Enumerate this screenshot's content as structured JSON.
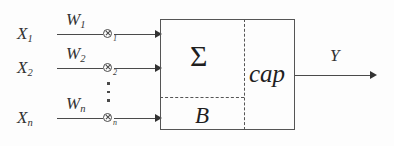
{
  "diagram": {
    "background_color": "#fdfdfd",
    "line_color": "#4a4a4a",
    "text_color": "#2b2b2b",
    "inputs": [
      {
        "input_label": "X",
        "input_subscript": "1",
        "weight_label": "W",
        "weight_subscript": "1",
        "operator_icon": "circled-times-icon",
        "operator_subscript": "1"
      },
      {
        "input_label": "X",
        "input_subscript": "2",
        "weight_label": "W",
        "weight_subscript": "2",
        "operator_icon": "circled-times-icon",
        "operator_subscript": "2"
      },
      {
        "input_label": "X",
        "input_subscript": "n",
        "weight_label": "W",
        "weight_subscript": "n",
        "operator_icon": "circled-times-icon",
        "operator_subscript": "n"
      }
    ],
    "ellipsis_icon": "vertical-ellipsis-icon",
    "processing_block": {
      "sum_symbol": "Σ",
      "bias_symbol": "B",
      "activation_label": "cap"
    },
    "output": {
      "label": "Y"
    }
  }
}
